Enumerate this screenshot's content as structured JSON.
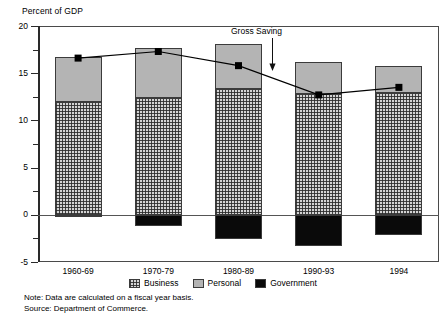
{
  "axis_title": "Percent of GDP",
  "annotation": {
    "label": "Gross Saving",
    "arrow_icon": "down-arrow-icon"
  },
  "legend": {
    "items": [
      {
        "label": "Business",
        "swatch": "business-checkered-swatch",
        "color": "#d4d4d4"
      },
      {
        "label": "Personal",
        "swatch": "personal-gray-swatch",
        "color": "#b4b4b4"
      },
      {
        "label": "Government",
        "swatch": "government-black-swatch",
        "color": "#0a0a0a"
      }
    ]
  },
  "notes": {
    "note": "Note: Data are calculated on a fiscal year basis.",
    "source": "Source: Department of Commerce."
  },
  "chart_data": {
    "type": "bar",
    "title": "",
    "xlabel": "",
    "ylabel": "Percent of GDP",
    "ylim": [
      -5,
      20
    ],
    "yticks": [
      -5,
      0,
      5,
      10,
      15,
      20
    ],
    "ytick_labels": [
      "-5",
      "0",
      "5",
      "10",
      "15",
      "20"
    ],
    "yminorticks": [
      -2.5,
      2.5,
      7.5,
      12.5,
      17.5
    ],
    "grid": false,
    "stacked": true,
    "legend_position": "bottom-center",
    "categories": [
      "1960-69",
      "1970-79",
      "1980-89",
      "1990-93",
      "1994"
    ],
    "series": [
      {
        "name": "Business",
        "values": [
          12.0,
          12.4,
          13.3,
          12.8,
          12.9
        ]
      },
      {
        "name": "Personal",
        "values": [
          4.7,
          5.3,
          4.8,
          3.4,
          2.9
        ]
      },
      {
        "name": "Government",
        "values": [
          -0.1,
          -1.2,
          -2.6,
          -3.3,
          -2.1
        ]
      }
    ],
    "bar_totals": [
      16.7,
      17.7,
      18.1,
      16.2,
      15.8
    ],
    "overlay_line": {
      "name": "Gross Saving",
      "type": "line",
      "marker": "square",
      "color": "#000000",
      "values": [
        16.6,
        17.3,
        15.8,
        12.7,
        13.5
      ]
    }
  }
}
